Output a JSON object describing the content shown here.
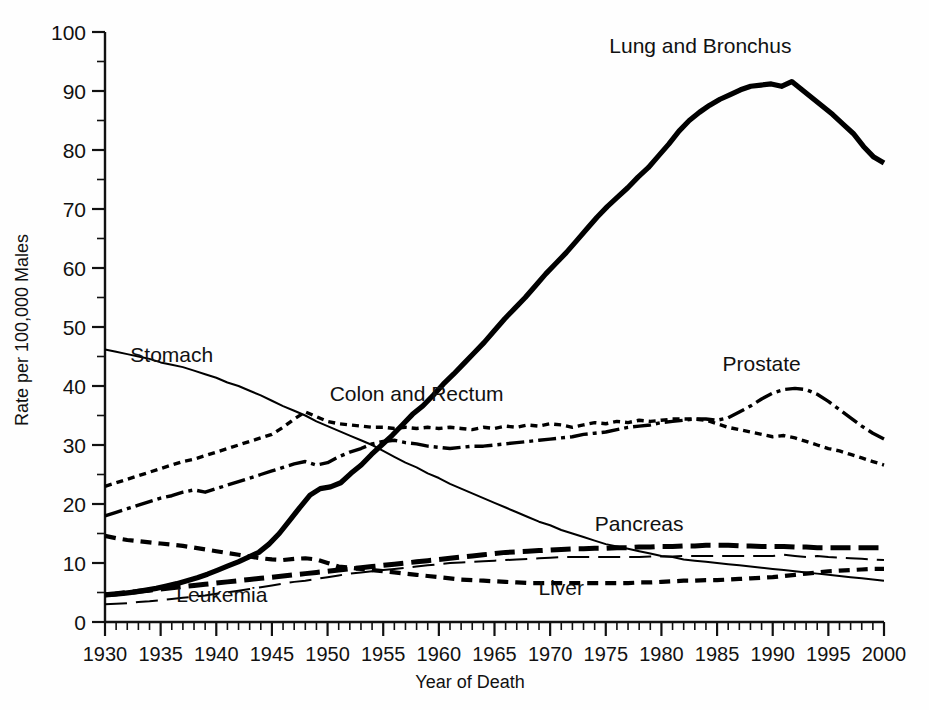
{
  "chart_data": {
    "type": "line",
    "title": "",
    "xlabel": "Year of Death",
    "ylabel": "Rate per 100,000 Males",
    "xlim": [
      1930,
      2000
    ],
    "ylim": [
      0,
      100
    ],
    "xticks": [
      1930,
      1935,
      1940,
      1945,
      1950,
      1955,
      1960,
      1965,
      1970,
      1975,
      1980,
      1985,
      1990,
      1995,
      2000
    ],
    "xtick_labels": [
      "1930",
      "1935",
      "1940",
      "1945",
      "1950",
      "1955",
      "1960",
      "1965",
      "1970",
      "1975",
      "1980",
      "1985",
      "1990",
      "1995",
      "2000"
    ],
    "yticks": [
      0,
      10,
      20,
      30,
      40,
      50,
      60,
      70,
      80,
      90,
      100
    ],
    "ytick_labels": [
      "0",
      "10",
      "20",
      "30",
      "40",
      "50",
      "60",
      "70",
      "80",
      "90",
      "100"
    ],
    "minor_x_step": 1,
    "minor_y_step": 5,
    "grid": false,
    "legend": "inline-labels",
    "x": [
      1930,
      1931,
      1932,
      1933,
      1934,
      1935,
      1936,
      1937,
      1938,
      1939,
      1940,
      1941,
      1942,
      1943,
      1944,
      1945,
      1946,
      1947,
      1948,
      1949,
      1950,
      1951,
      1952,
      1953,
      1954,
      1955,
      1956,
      1957,
      1958,
      1959,
      1960,
      1961,
      1962,
      1963,
      1964,
      1965,
      1966,
      1967,
      1968,
      1969,
      1970,
      1971,
      1972,
      1973,
      1974,
      1975,
      1976,
      1977,
      1978,
      1979,
      1980,
      1981,
      1982,
      1983,
      1984,
      1985,
      1986,
      1987,
      1988,
      1989,
      1990,
      1991,
      1992,
      1993,
      1994,
      1995,
      1996,
      1997,
      1998,
      1999,
      2000
    ],
    "series": [
      {
        "name": "Lung and Bronchus",
        "label": "Lung and Bronchus",
        "style": "solid-thick",
        "label_xy": [
          1983.5,
          96.5
        ],
        "values": [
          4.6,
          4.7,
          4.9,
          5.1,
          5.4,
          5.7,
          6.1,
          6.5,
          7.0,
          7.5,
          8.1,
          8.8,
          9.5,
          10.2,
          11.0,
          11.8,
          13.2,
          15.0,
          17.2,
          19.4,
          21.5,
          22.6,
          22.9,
          23.6,
          25.2,
          26.6,
          28.4,
          30.0,
          31.6,
          33.4,
          35.2,
          36.6,
          38.4,
          40.3,
          42.0,
          43.8,
          45.6,
          47.4,
          49.4,
          51.4,
          53.2,
          55.0,
          57.0,
          59.0,
          60.8,
          62.6,
          64.6,
          66.6,
          68.6,
          70.4,
          72.0,
          73.6,
          75.4,
          77.0,
          79.0,
          81.0,
          83.2,
          85.0,
          86.4,
          87.6,
          88.6,
          89.4,
          90.2,
          90.8,
          91.0,
          91.2,
          90.8,
          91.6,
          90.2,
          88.8,
          87.4
        ],
        "values_tail": [
          86.0,
          84.4,
          82.8,
          80.6,
          78.8,
          77.8
        ]
      },
      {
        "name": "Stomach",
        "label": "Stomach",
        "style": "solid-thin",
        "label_xy": [
          1936.0,
          44.0
        ],
        "values": [
          46.2,
          45.8,
          45.4,
          45.0,
          44.6,
          44.0,
          43.6,
          43.2,
          42.6,
          42.0,
          41.4,
          40.6,
          40.0,
          39.2,
          38.4,
          37.5,
          36.6,
          35.8,
          35.0,
          34.0,
          33.2,
          32.4,
          31.6,
          30.8,
          30.0,
          29.0,
          28.0,
          27.0,
          26.2,
          25.2,
          24.4,
          23.4,
          22.6,
          21.8,
          21.0,
          20.2,
          19.4,
          18.6,
          17.8,
          17.0,
          16.4,
          15.6,
          15.0,
          14.4,
          13.8,
          13.2,
          12.8,
          12.4,
          12.0,
          11.6,
          11.2,
          11.0,
          10.6,
          10.4,
          10.2,
          10.0,
          9.8,
          9.6,
          9.4,
          9.2,
          9.0,
          8.8,
          8.6,
          8.4,
          8.2,
          8.0,
          7.8,
          7.6,
          7.4,
          7.2,
          7.0
        ]
      },
      {
        "name": "Colon and Rectum",
        "label": "Colon and Rectum",
        "style": "dotted",
        "label_xy": [
          1958.0,
          37.5
        ],
        "values": [
          23.0,
          23.6,
          24.2,
          24.8,
          25.4,
          26.0,
          26.6,
          27.2,
          27.6,
          28.2,
          28.8,
          29.4,
          30.0,
          30.6,
          31.2,
          31.8,
          33.0,
          34.4,
          35.6,
          34.8,
          34.0,
          33.6,
          33.4,
          33.2,
          33.0,
          33.0,
          32.8,
          33.0,
          32.8,
          33.0,
          32.8,
          33.0,
          32.8,
          32.6,
          33.0,
          32.8,
          33.2,
          33.0,
          33.4,
          33.2,
          33.6,
          33.4,
          33.0,
          33.4,
          33.8,
          33.6,
          34.0,
          33.8,
          34.2,
          34.0,
          34.2,
          34.4,
          34.4,
          34.4,
          34.2,
          33.6,
          33.0,
          32.6,
          32.2,
          31.8,
          31.4,
          31.6,
          31.2,
          30.6,
          30.0,
          29.4,
          29.0,
          28.4,
          27.8,
          27.2,
          26.6
        ]
      },
      {
        "name": "Prostate",
        "label": "Prostate",
        "style": "dashdot",
        "label_xy": [
          1989.0,
          42.5
        ],
        "values": [
          18.0,
          18.6,
          19.2,
          19.8,
          20.4,
          21.0,
          21.4,
          22.0,
          22.4,
          22.0,
          22.6,
          23.2,
          23.8,
          24.4,
          25.0,
          25.6,
          26.2,
          26.8,
          27.2,
          26.6,
          27.0,
          28.0,
          28.8,
          29.4,
          30.2,
          30.6,
          30.8,
          30.4,
          30.2,
          29.8,
          29.6,
          29.4,
          29.6,
          29.8,
          29.8,
          30.0,
          30.2,
          30.4,
          30.6,
          30.8,
          31.0,
          31.2,
          31.4,
          31.8,
          32.0,
          32.2,
          32.6,
          33.0,
          33.2,
          33.4,
          33.8,
          34.0,
          34.2,
          34.4,
          34.4,
          34.2,
          34.6,
          35.6,
          36.6,
          37.8,
          38.8,
          39.4,
          39.6,
          39.4,
          38.6,
          37.4,
          36.0,
          34.6,
          33.2,
          32.0,
          31.0
        ]
      },
      {
        "name": "Pancreas",
        "label": "Pancreas",
        "style": "dash-thick",
        "label_xy": [
          1978.0,
          15.5
        ],
        "values": [
          4.6,
          4.8,
          5.0,
          5.2,
          5.4,
          5.6,
          5.8,
          6.0,
          6.2,
          6.4,
          6.6,
          6.8,
          7.0,
          7.2,
          7.4,
          7.6,
          7.8,
          8.0,
          8.2,
          8.4,
          8.6,
          8.8,
          9.0,
          9.2,
          9.4,
          9.6,
          9.8,
          10.0,
          10.2,
          10.4,
          10.6,
          10.8,
          11.0,
          11.2,
          11.4,
          11.6,
          11.8,
          11.9,
          12.0,
          12.1,
          12.2,
          12.3,
          12.4,
          12.4,
          12.5,
          12.5,
          12.6,
          12.6,
          12.7,
          12.7,
          12.8,
          12.8,
          12.9,
          12.9,
          13.0,
          13.0,
          13.0,
          12.9,
          12.9,
          12.8,
          12.8,
          12.8,
          12.7,
          12.7,
          12.6,
          12.6,
          12.6,
          12.6,
          12.6,
          12.6,
          12.6
        ]
      },
      {
        "name": "Leukemia",
        "label": "Leukemia",
        "style": "longdash-thin",
        "label_xy": [
          1940.5,
          3.4
        ],
        "values": [
          3.0,
          3.1,
          3.2,
          3.4,
          3.5,
          3.7,
          3.9,
          4.1,
          4.3,
          4.5,
          4.8,
          5.0,
          5.3,
          5.6,
          5.9,
          6.2,
          6.5,
          6.8,
          7.0,
          7.3,
          7.6,
          7.9,
          8.2,
          8.4,
          8.6,
          8.8,
          9.0,
          9.2,
          9.4,
          9.6,
          9.8,
          10.0,
          10.1,
          10.2,
          10.3,
          10.4,
          10.5,
          10.6,
          10.7,
          10.8,
          10.9,
          11.0,
          11.0,
          11.0,
          11.0,
          11.0,
          11.0,
          11.0,
          11.0,
          11.1,
          11.1,
          11.1,
          11.2,
          11.2,
          11.2,
          11.2,
          11.2,
          11.2,
          11.2,
          11.2,
          11.2,
          11.4,
          11.2,
          11.0,
          11.2,
          11.0,
          10.9,
          10.8,
          10.7,
          10.6,
          10.5
        ]
      },
      {
        "name": "Liver",
        "label": "Liver",
        "style": "dash-medium",
        "label_xy": [
          1971.0,
          4.6
        ],
        "values": [
          14.6,
          14.2,
          13.9,
          13.7,
          13.5,
          13.3,
          13.1,
          12.9,
          12.6,
          12.3,
          12.0,
          11.7,
          11.4,
          11.1,
          10.8,
          10.6,
          10.5,
          10.7,
          10.8,
          10.6,
          10.0,
          9.4,
          9.2,
          9.0,
          8.8,
          8.6,
          8.4,
          8.2,
          8.0,
          7.8,
          7.6,
          7.4,
          7.2,
          7.1,
          7.0,
          6.9,
          6.8,
          6.7,
          6.6,
          6.6,
          6.6,
          6.6,
          6.6,
          6.6,
          6.6,
          6.6,
          6.6,
          6.6,
          6.7,
          6.7,
          6.8,
          6.9,
          7.0,
          7.0,
          7.1,
          7.1,
          7.2,
          7.3,
          7.4,
          7.5,
          7.6,
          7.8,
          8.0,
          8.2,
          8.4,
          8.6,
          8.7,
          8.8,
          8.9,
          9.0,
          9.0
        ]
      }
    ]
  },
  "axes": {
    "y_axis_title": "Rate per 100,000 Males",
    "x_axis_title": "Year of Death"
  }
}
